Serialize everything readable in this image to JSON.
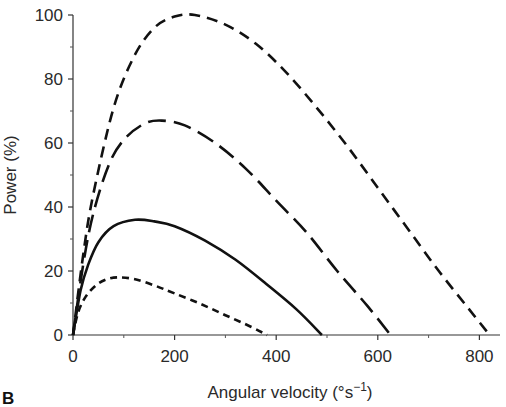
{
  "chart_data": {
    "type": "line",
    "title": "",
    "panel_label": "B",
    "xlabel": "Angular velocity (°s⁻¹)",
    "xlabel_base": "Angular velocity (°s",
    "xlabel_sup": "−1",
    "xlabel_close": ")",
    "ylabel": "Power (%)",
    "xlim": [
      0,
      840
    ],
    "ylim": [
      0,
      100
    ],
    "x_ticks": [
      0,
      200,
      400,
      600,
      800
    ],
    "x_minor_ticks": [
      100,
      300,
      500,
      700
    ],
    "y_ticks": [
      0,
      20,
      40,
      60,
      80,
      100
    ],
    "y_minor_ticks": [
      10,
      30,
      50,
      70,
      90
    ],
    "grid": false,
    "legend": null,
    "series": [
      {
        "name": "curve-1 (short dash, peak 100%)",
        "style": "dashed-medium",
        "vmax": 820,
        "peak": {
          "x": 240,
          "y": 100
        },
        "x": [
          0,
          20,
          40,
          80,
          120,
          160,
          200,
          240,
          300,
          360,
          420,
          480,
          540,
          600,
          660,
          720,
          780,
          820
        ],
        "y": [
          0,
          25,
          44,
          71,
          87,
          96,
          99.5,
          100,
          97,
          91,
          82,
          71,
          59,
          46,
          33,
          20,
          8,
          0
        ]
      },
      {
        "name": "curve-2 (long dash, peak 67%)",
        "style": "dashed-long",
        "vmax": 625,
        "peak": {
          "x": 175,
          "y": 67
        },
        "x": [
          0,
          20,
          40,
          70,
          100,
          140,
          175,
          220,
          280,
          340,
          400,
          460,
          520,
          580,
          625
        ],
        "y": [
          0,
          22,
          38,
          53,
          61,
          66,
          67,
          65.5,
          60,
          52,
          42,
          32,
          20,
          9,
          0
        ]
      },
      {
        "name": "curve-3 (solid, peak 36%)",
        "style": "solid",
        "vmax": 490,
        "peak": {
          "x": 122,
          "y": 36
        },
        "x": [
          0,
          15,
          30,
          50,
          80,
          122,
          160,
          200,
          260,
          320,
          380,
          440,
          490
        ],
        "y": [
          0,
          14,
          22,
          29,
          34,
          36,
          35.5,
          34,
          29.5,
          23.5,
          16,
          8,
          0
        ]
      },
      {
        "name": "curve-4 (short dash, peak 18%)",
        "style": "dashed-short",
        "vmax": 382,
        "peak": {
          "x": 88,
          "y": 18
        },
        "x": [
          0,
          10,
          25,
          45,
          65,
          88,
          120,
          160,
          200,
          250,
          300,
          350,
          382
        ],
        "y": [
          0,
          7,
          12,
          15.5,
          17.3,
          18,
          17.5,
          15.5,
          13,
          9.8,
          6.2,
          2.6,
          0
        ]
      }
    ]
  }
}
